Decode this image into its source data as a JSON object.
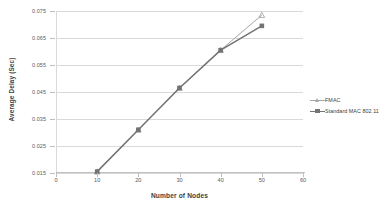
{
  "chart_data": {
    "type": "line",
    "title": "",
    "xlabel": "Number of Nodes",
    "ylabel": "Average Delay (Sec)",
    "x": [
      10,
      20,
      30,
      40,
      50
    ],
    "xlim": [
      0,
      60
    ],
    "ylim": [
      0.015,
      0.075
    ],
    "xticks": [
      "0",
      "10",
      "20",
      "30",
      "40",
      "50",
      "60"
    ],
    "yticks": [
      "0.015",
      "0.025",
      "0.035",
      "0.045",
      "0.055",
      "0.065",
      "0.075"
    ],
    "grid": "horizontal",
    "legend_position": "right",
    "series": [
      {
        "name": "FMAC",
        "color": "#a6a6a6",
        "marker": "triangle",
        "values": [
          0.0155,
          0.031,
          0.0465,
          0.0605,
          0.0735
        ]
      },
      {
        "name": "Standard MAC 802.11",
        "color": "#737373",
        "marker": "square",
        "values": [
          0.0155,
          0.031,
          0.0465,
          0.0605,
          0.0695
        ]
      }
    ]
  },
  "legend": {
    "items": [
      {
        "label": "FMAC"
      },
      {
        "label": "Standard MAC 802.11"
      }
    ]
  },
  "colors": {
    "series_fmac": "#a6a6a6",
    "series_standard": "#737373",
    "gridline": "#d9d9d9",
    "axis": "#bfbfbf",
    "tick_text": "#595959",
    "title_text": "#404040",
    "background": "#ffffff"
  }
}
